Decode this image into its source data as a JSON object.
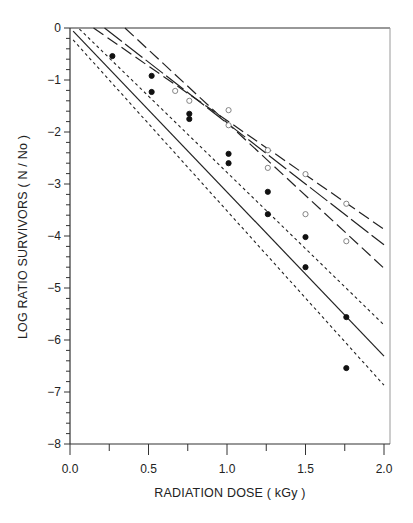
{
  "chart_data": {
    "type": "scatter",
    "title": "",
    "xlabel": "RADIATION DOSE ( kGy )",
    "ylabel": "LOG RATIO SURVIVORS ( N / No )",
    "xlim": [
      0.0,
      2.0
    ],
    "ylim": [
      -8,
      0
    ],
    "x_ticks": [
      0.0,
      0.5,
      1.0,
      1.5,
      2.0
    ],
    "x_tick_labels": [
      "0.0",
      "0.5",
      "1.0",
      "1.5",
      "2.0"
    ],
    "y_ticks": [
      0,
      -1,
      -2,
      -3,
      -4,
      -5,
      -6,
      -7,
      -8
    ],
    "y_tick_labels": [
      "0",
      "−1",
      "−2",
      "−3",
      "−4",
      "−5",
      "−6",
      "−7",
      "−8"
    ],
    "grid": false,
    "legend": null,
    "series": [
      {
        "name": "filled points",
        "marker": "filled-circle",
        "points": [
          [
            0.27,
            -0.54
          ],
          [
            0.52,
            -0.92
          ],
          [
            0.52,
            -1.23
          ],
          [
            0.76,
            -1.65
          ],
          [
            0.76,
            -1.75
          ],
          [
            1.01,
            -2.42
          ],
          [
            1.01,
            -2.6
          ],
          [
            1.26,
            -3.15
          ],
          [
            1.26,
            -3.58
          ],
          [
            1.5,
            -4.02
          ],
          [
            1.5,
            -4.6
          ],
          [
            1.76,
            -5.56
          ],
          [
            1.76,
            -6.54
          ]
        ]
      },
      {
        "name": "open points",
        "marker": "open-circle",
        "points": [
          [
            0.67,
            -1.21
          ],
          [
            0.76,
            -1.4
          ],
          [
            1.01,
            -1.58
          ],
          [
            1.01,
            -1.87
          ],
          [
            1.26,
            -2.35
          ],
          [
            1.26,
            -2.69
          ],
          [
            1.5,
            -2.81
          ],
          [
            1.5,
            -3.58
          ],
          [
            1.76,
            -3.38
          ],
          [
            1.76,
            -4.1
          ]
        ]
      }
    ],
    "lines": [
      {
        "name": "filled regression",
        "style": "solid",
        "x": [
          0.02,
          2.0
        ],
        "y": [
          -0.06,
          -6.31
        ]
      },
      {
        "name": "filled upper confidence",
        "style": "dotted",
        "x": [
          0.06,
          2.0
        ],
        "y": [
          -0.02,
          -5.71
        ]
      },
      {
        "name": "filled lower confidence",
        "style": "dotted",
        "x": [
          0.02,
          2.0
        ],
        "y": [
          -0.23,
          -6.87
        ]
      },
      {
        "name": "open upper confidence",
        "style": "long-dash",
        "x": [
          0.15,
          2.0
        ],
        "y": [
          0.0,
          -3.87
        ]
      },
      {
        "name": "open regression",
        "style": "long-dash-solid",
        "x": [
          0.22,
          2.0
        ],
        "y": [
          0.0,
          -4.17
        ]
      },
      {
        "name": "open lower confidence",
        "style": "long-dash",
        "x": [
          0.35,
          2.0
        ],
        "y": [
          0.0,
          -4.62
        ]
      }
    ]
  }
}
